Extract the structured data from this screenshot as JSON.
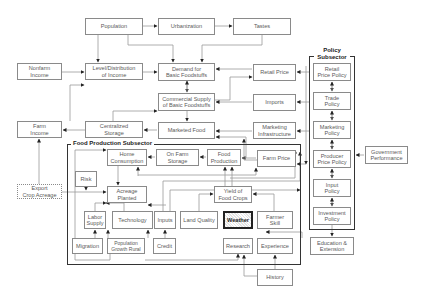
{
  "diagram": {
    "accent_colors": {
      "box_border": "#8a8a8a",
      "frame_border": "#333333",
      "weather_fill": "#e4e4e4"
    },
    "subsectors": {
      "food_production": "Food Production Subsector",
      "policy": "Policy\nSubsector"
    },
    "nodes": {
      "population": "Population",
      "urbanization": "Urbanization",
      "tastes": "Tastes",
      "nonfarm_income": "Nonfarm\nIncome",
      "level_distribution_income": "Level/Distribution\nof Income",
      "demand_basic_foodstuffs": "Demand for\nBasic Foodstuffs",
      "retail_price": "Retail Price",
      "commercial_supply": "Commercial Supply\nof Basic Foodstuffs",
      "imports": "Imports",
      "farm_income": "Farm\nIncome",
      "centralized_storage": "Centralized\nStorage",
      "marketed_food": "Marketed Food",
      "marketing_infrastructure": "Marketing\nInfrastructure",
      "home_consumption": "Home\nConsumption",
      "on_farm_storage": "On Farm\nStorage",
      "food_production": "Food\nProduction",
      "farm_price": "Farm Price",
      "risk": "Risk",
      "export_crop_acreage": "Export\nCrop Acreage",
      "acreage_planted": "Acreage\nPlanted",
      "yield_food_crops": "Yield of\nFood Crops",
      "labor_supply": "Labor\nSupply",
      "technology": "Technology",
      "inputs": "Inputs",
      "land_quality": "Land Quality",
      "weather": "Weather",
      "farmer_skill": "Farmer\nSkill",
      "migration": "Migration",
      "population_growth_rural": "Population\nGrowth Rural",
      "credit": "Credit",
      "research": "Research",
      "experience": "Experience",
      "history": "History",
      "retail_price_policy": "Retail\nPrice Policy",
      "trade_policy": "Trade\nPolicy",
      "marketing_policy": "Marketing\nPolicy",
      "producer_price_policy": "Producer\nPrice Policy",
      "input_policy": "Input\nPolicy",
      "investment_policy": "Investment\nPolicy",
      "government_performance": "Government\nPerformance",
      "education_extension": "Education &\nExtension"
    }
  }
}
